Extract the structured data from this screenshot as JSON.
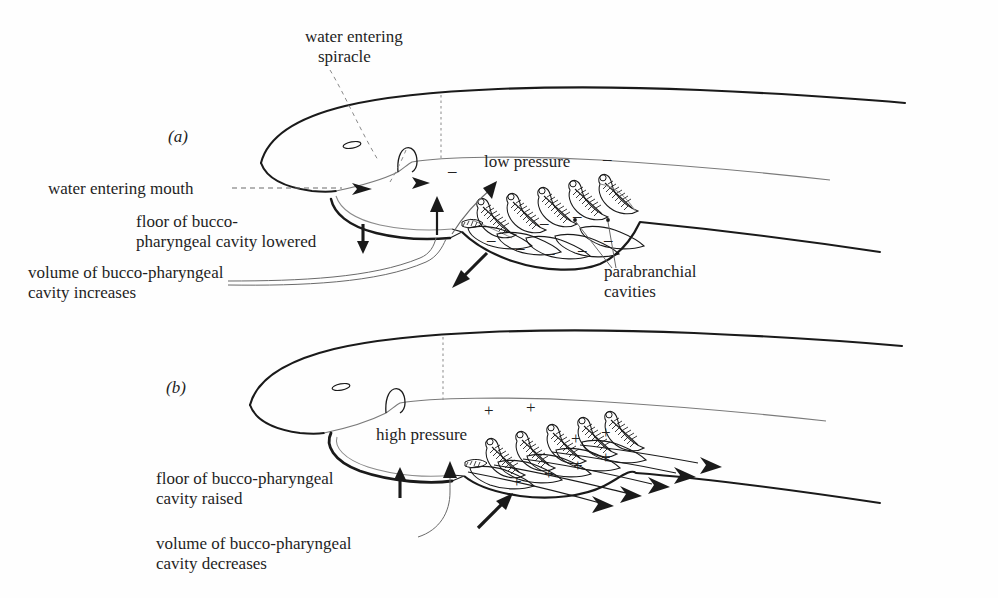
{
  "figure": {
    "domain_note": "Scientific line diagram: two-panel illustration of elasmobranch (shark/ray) gill ventilation mechanism",
    "background_color": "#fefefe",
    "ink_color": "#1a1a1a"
  },
  "panels": [
    {
      "id": "a",
      "id_label": "(a)",
      "phase": "expansion / inhalation",
      "pressure_label": "low pressure",
      "pressure_sign": "–",
      "sign_count": 9,
      "labels": [
        {
          "name": "water-entering-spiracle",
          "text": "water entering\nspiracle"
        },
        {
          "name": "water-entering-mouth",
          "text": "water entering mouth"
        },
        {
          "name": "floor-lowered",
          "text": "floor of bucco-\npharyngeal cavity lowered"
        },
        {
          "name": "volume-increases",
          "text": "volume of bucco-pharyngeal\ncavity increases"
        },
        {
          "name": "parabranchial-cavities",
          "text": "parabranchial\ncavities"
        }
      ],
      "arrow_notes": "inflow arrowheads at spiracle and mouth; upward arrow into buccal cavity; bold arrow down-left showing expansion; bold down arrow beside floor label"
    },
    {
      "id": "b",
      "id_label": "(b)",
      "phase": "compression / exhalation",
      "pressure_label": "high pressure",
      "pressure_sign": "+",
      "sign_count": 8,
      "labels": [
        {
          "name": "floor-raised",
          "text": "floor of bucco-pharyngeal\ncavity raised"
        },
        {
          "name": "volume-decreases",
          "text": "volume of bucco-pharyngeal\ncavity decreases"
        }
      ],
      "exit_arrowheads": 5,
      "arrow_notes": "bold up arrow beside floor label; bold arrow up-right showing compression; five arrowheads along gill slits showing water leaving"
    }
  ],
  "anatomy": {
    "gill_arches_per_panel": 5,
    "features": [
      "eye",
      "spiracle",
      "mouth",
      "bucco-pharyngeal cavity floor",
      "gill lamellae",
      "parabranchial cavities",
      "gill slits",
      "body outline",
      "tail"
    ]
  },
  "labels_flat": {
    "panel_a_id": "(a)",
    "panel_b_id": "(b)",
    "water_entering_spiracle_l1": "water entering",
    "water_entering_spiracle_l2": "spiracle",
    "water_entering_mouth": "water entering mouth",
    "low_pressure": "low pressure",
    "floor_lowered_l1": "floor of bucco-",
    "floor_lowered_l2": "pharyngeal cavity lowered",
    "volume_increases_l1": "volume of bucco-pharyngeal",
    "volume_increases_l2": "cavity increases",
    "parabranchial_l1": "parabranchial",
    "parabranchial_l2": "cavities",
    "high_pressure": "high pressure",
    "floor_raised_l1": "floor of bucco-pharyngeal",
    "floor_raised_l2": "cavity raised",
    "volume_decreases_l1": "volume of bucco-pharyngeal",
    "volume_decreases_l2": "cavity decreases",
    "minus": "–",
    "plus": "+",
    "arrow_down": "↓",
    "arrow_up": "↑"
  }
}
